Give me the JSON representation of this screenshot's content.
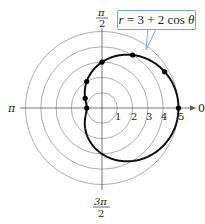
{
  "chart_data": {
    "type": "polar-line",
    "title": "",
    "equation": "r = 3 + 2 cos θ",
    "equation_label": "r = 3 + 2 cos θ",
    "grid": {
      "circles": [
        1,
        2,
        3,
        4,
        5
      ],
      "radial_tick_labels": [
        "1",
        "2",
        "3",
        "4",
        "5"
      ],
      "angle_labels": {
        "0": "0",
        "pi_over_2": "π/2",
        "pi": "π",
        "three_pi_over_2": "3π/2"
      }
    },
    "rlim": [
      0,
      5
    ],
    "series": [
      {
        "name": "r = 3 + 2 cos θ",
        "curve": "limacon",
        "a": 3,
        "b": 2,
        "points": [
          {
            "theta": "0",
            "theta_rad": 0,
            "r": 5
          },
          {
            "theta": "π/6",
            "theta_rad": 0.5236,
            "r": 4.73
          },
          {
            "theta": "π/3",
            "theta_rad": 1.0472,
            "r": 4
          },
          {
            "theta": "π/2",
            "theta_rad": 1.5708,
            "r": 3
          },
          {
            "theta": "2π/3",
            "theta_rad": 2.0944,
            "r": 2
          },
          {
            "theta": "5π/6",
            "theta_rad": 2.618,
            "r": 1.27
          },
          {
            "theta": "π",
            "theta_rad": 3.1416,
            "r": 1
          }
        ]
      }
    ]
  },
  "labels": {
    "zero": "0",
    "pi": "π",
    "half_pi_num": "π",
    "half_pi_den": "2",
    "three_half_pi_num": "3π",
    "three_half_pi_den": "2",
    "r1": "1",
    "r2": "2",
    "r3": "3",
    "r4": "4",
    "r5": "5",
    "callout_r": "r",
    "callout_rest": " = 3 + 2 cos ",
    "callout_theta": "θ"
  },
  "colors": {
    "grid": "#8a8a8a",
    "axis": "#555555",
    "curve": "#111111",
    "callout_border": "#6fa9d8"
  }
}
